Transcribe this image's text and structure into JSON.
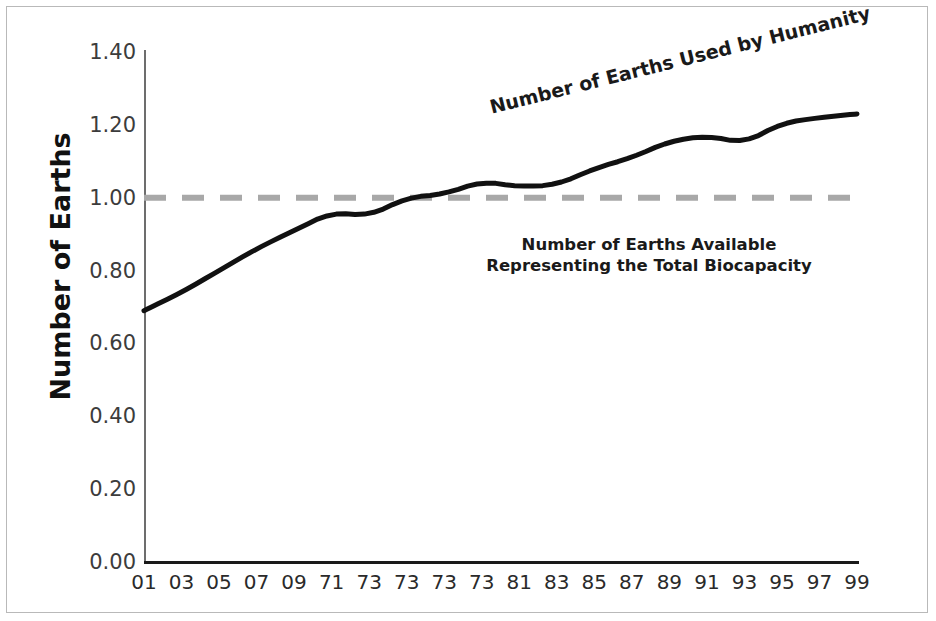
{
  "chart_data": {
    "type": "line",
    "title": "",
    "xlabel": "",
    "ylabel": "Number of Earths",
    "ylim": [
      0.0,
      1.4
    ],
    "ytick_step": 0.2,
    "grid": false,
    "legend_position": "inline-annotations",
    "categories": [
      "01",
      "03",
      "05",
      "07",
      "09",
      "71",
      "73",
      "73",
      "73",
      "73",
      "81",
      "83",
      "85",
      "87",
      "89",
      "91",
      "93",
      "95",
      "97",
      "99"
    ],
    "series": [
      {
        "name": "Number of Earths Used by Humanity",
        "style": "solid",
        "color": "#111111",
        "width": 5,
        "values": [
          0.69,
          0.74,
          0.8,
          0.86,
          0.91,
          0.96,
          0.95,
          1.0,
          1.01,
          1.045,
          1.03,
          1.035,
          1.08,
          1.11,
          1.155,
          1.17,
          1.15,
          1.205,
          1.22,
          1.23
        ]
      },
      {
        "name": "Number of Earths Available Representing the Total Biocapacity",
        "style": "dashed",
        "color": "#a8a8a8",
        "width": 6,
        "constant_value": 1.0,
        "values": [
          1.0,
          1.0,
          1.0,
          1.0,
          1.0,
          1.0,
          1.0,
          1.0,
          1.0,
          1.0,
          1.0,
          1.0,
          1.0,
          1.0,
          1.0,
          1.0,
          1.0,
          1.0,
          1.0,
          1.0
        ]
      }
    ],
    "ytick_labels": [
      "0.00",
      "0.20",
      "0.40",
      "0.60",
      "0.80",
      "1.00",
      "1.20",
      "1.40"
    ],
    "ytick_values": [
      0.0,
      0.2,
      0.4,
      0.6,
      0.8,
      1.0,
      1.2,
      1.4
    ],
    "annotations": [
      {
        "id": "used-by-humanity",
        "text": "Number of Earths Used by Humanity",
        "rotation_deg": -14,
        "bold": true
      },
      {
        "id": "earths-available",
        "line1": "Number of Earths Available",
        "line2": "Representing the Total Biocapacity",
        "rotation_deg": 0,
        "bold": true
      }
    ],
    "colors": {
      "used_line": "#111111",
      "available_line": "#a8a8a8",
      "axis": "#1a1a1a",
      "axis_y": "#6d6d6d",
      "tick_text": "#3c3c3c",
      "frame_border": "#b9b9b9",
      "background": "#ffffff"
    }
  },
  "axis": {
    "y_title": "Number of Earths"
  }
}
